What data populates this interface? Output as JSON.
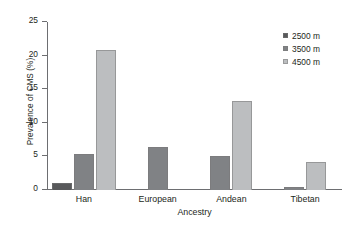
{
  "chart_data": {
    "type": "bar",
    "title": "",
    "xlabel": "Ancestry",
    "ylabel": "Prevalence of CMS (%)",
    "categories": [
      "Han",
      "European",
      "Andean",
      "Tibetan"
    ],
    "series": [
      {
        "name": "2500 m",
        "color": "#58595b",
        "values": [
          1.0,
          null,
          null,
          null
        ]
      },
      {
        "name": "3500 m",
        "color": "#808285",
        "values": [
          5.3,
          6.4,
          5.0,
          0.5
        ]
      },
      {
        "name": "4500 m",
        "color": "#bcbec0",
        "values": [
          20.9,
          null,
          13.2,
          4.2
        ]
      }
    ],
    "ylim": [
      0,
      25
    ],
    "yticks": [
      0,
      5,
      10,
      15,
      20,
      25
    ],
    "ytick_labels": [
      "0",
      "5",
      "10",
      "15",
      "20",
      "25"
    ],
    "grid": false,
    "legend_position": "top-right"
  }
}
